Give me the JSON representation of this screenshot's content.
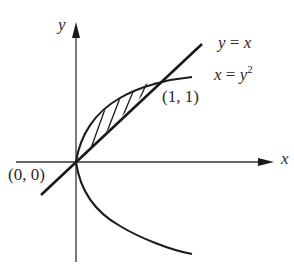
{
  "diagram": {
    "type": "region-between-curves",
    "axes": {
      "x_label": "x",
      "y_label": "y"
    },
    "curves": [
      {
        "name": "line",
        "equation_lhs": "y",
        "equation_rhs": "x",
        "label": "y = x"
      },
      {
        "name": "parabola",
        "equation_lhs": "x",
        "equation_rhs": "y",
        "exponent": "2",
        "label": "x = y^2"
      }
    ],
    "points": [
      {
        "label": "(0, 0)",
        "x": 0,
        "y": 0
      },
      {
        "label": "(1, 1)",
        "x": 1,
        "y": 1
      }
    ],
    "shaded_region": "between y = x and x = y^2 for 0 ≤ x ≤ 1",
    "colors": {
      "stroke": "#1a1a1a",
      "background": "#ffffff"
    }
  }
}
